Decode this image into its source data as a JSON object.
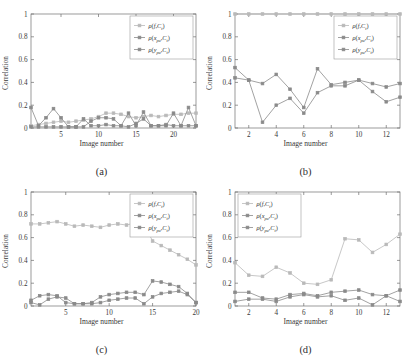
{
  "figure": {
    "axis_labels": {
      "x": "Image number",
      "y": "Correlation"
    },
    "series_names": {
      "s1": "ρ(f,C_t)",
      "s2": "ρ(x_pu,C_t)",
      "s3": "ρ(y_pu,C_t)"
    },
    "colors": {
      "s1": "#b9b9b9",
      "s2": "#8a8a8a",
      "s3": "#8a8a8a",
      "axis": "#6f6f6f"
    }
  },
  "chart_data": [
    {
      "type": "line",
      "panel": "a",
      "caption": "(a)",
      "title": "",
      "xlabel": "Image number",
      "ylabel": "Correlation",
      "xlim": [
        1,
        23
      ],
      "ylim": [
        0,
        1
      ],
      "xticks": [
        5,
        10,
        15,
        20
      ],
      "yticks": [
        0,
        0.2,
        0.4,
        0.6,
        0.8,
        1
      ],
      "ytick_labels": [
        "0",
        "0.2",
        "0.4",
        "0.6",
        "0.8",
        "1"
      ],
      "grid": false,
      "legend_position": "top-right",
      "x": [
        1,
        2,
        3,
        4,
        5,
        6,
        7,
        8,
        9,
        10,
        11,
        12,
        13,
        14,
        15,
        16,
        17,
        18,
        19,
        20,
        21,
        22,
        23
      ],
      "series": [
        {
          "name": "ρ(f,C_t)",
          "color": "#b9b9b9",
          "values": [
            0.02,
            0.03,
            0.04,
            0.05,
            0.06,
            0.05,
            0.06,
            0.07,
            0.08,
            0.1,
            0.13,
            0.13,
            0.12,
            0.1,
            0.09,
            0.1,
            0.11,
            0.1,
            0.11,
            0.12,
            0.12,
            0.13,
            0.13
          ]
        },
        {
          "name": "ρ(x_pu,C_t)",
          "color": "#8a8a8a",
          "values": [
            0.18,
            0.02,
            0.09,
            0.17,
            0.09,
            0.01,
            0.01,
            0.08,
            0.02,
            0.02,
            0.03,
            0.02,
            0.02,
            0.13,
            0.02,
            0.14,
            0.02,
            0.02,
            0.02,
            0.13,
            0.02,
            0.18,
            0.02
          ]
        },
        {
          "name": "ρ(y_pu,C_t)",
          "color": "#8a8a8a",
          "values": [
            0.01,
            0.01,
            0.01,
            0.01,
            0.01,
            0.01,
            0.01,
            0.01,
            0.06,
            0.09,
            0.09,
            0.08,
            0.02,
            0.01,
            0.04,
            0.08,
            0.02,
            0.02,
            0.03,
            0.02,
            0.02,
            0.02,
            0.02
          ]
        }
      ]
    },
    {
      "type": "line",
      "panel": "b",
      "caption": "(b)",
      "title": "",
      "xlabel": "Image number",
      "ylabel": "Correlation",
      "xlim": [
        1,
        13
      ],
      "ylim": [
        0,
        1
      ],
      "xticks": [
        2,
        4,
        6,
        8,
        10,
        12
      ],
      "yticks": [
        0,
        0.2,
        0.4,
        0.6,
        0.8,
        1
      ],
      "ytick_labels": [
        "0",
        "0.2",
        "0.4",
        "0.6",
        "0.8",
        "1"
      ],
      "grid": false,
      "legend_position": "top-right",
      "x": [
        1,
        2,
        3,
        4,
        5,
        6,
        7,
        8,
        9,
        10,
        11,
        12,
        13
      ],
      "series": [
        {
          "name": "ρ(f,C_t)",
          "color": "#b9b9b9",
          "values": [
            1,
            1,
            1,
            1,
            1,
            1,
            1,
            1,
            1,
            1,
            1,
            1,
            1
          ]
        },
        {
          "name": "ρ(x_pu,C_t)",
          "color": "#8a8a8a",
          "values": [
            0.53,
            0.42,
            0.39,
            0.47,
            0.34,
            0.18,
            0.52,
            0.38,
            0.4,
            0.42,
            0.39,
            0.36,
            0.39
          ]
        },
        {
          "name": "ρ(y_pu,C_t)",
          "color": "#8a8a8a",
          "values": [
            0.44,
            0.42,
            0.05,
            0.2,
            0.26,
            0.13,
            0.31,
            0.37,
            0.37,
            0.42,
            0.32,
            0.23,
            0.27
          ]
        }
      ]
    },
    {
      "type": "line",
      "panel": "c",
      "caption": "(c)",
      "title": "",
      "xlabel": "Image number",
      "ylabel": "Correlation",
      "xlim": [
        1,
        20
      ],
      "ylim": [
        0,
        1
      ],
      "xticks": [
        5,
        10,
        15,
        20
      ],
      "yticks": [
        0,
        0.2,
        0.4,
        0.6,
        0.8,
        1
      ],
      "ytick_labels": [
        "0",
        "0.2",
        "0.4",
        "0.6",
        "0.8",
        "1"
      ],
      "grid": false,
      "legend_position": "top-right",
      "x": [
        1,
        2,
        3,
        4,
        5,
        6,
        7,
        8,
        9,
        10,
        11,
        12,
        13,
        14,
        15,
        16,
        17,
        18,
        19,
        20
      ],
      "series": [
        {
          "name": "ρ(f,C_t)",
          "color": "#b9b9b9",
          "values": [
            0.72,
            0.72,
            0.73,
            0.74,
            0.72,
            0.7,
            0.71,
            0.7,
            0.69,
            0.71,
            0.72,
            0.71,
            0.73,
            0.72,
            0.57,
            0.53,
            0.49,
            0.45,
            0.41,
            0.36
          ]
        },
        {
          "name": "ρ(x_pu,C_t)",
          "color": "#8a8a8a",
          "values": [
            0.05,
            0.09,
            0.1,
            0.09,
            0.03,
            0.02,
            0.02,
            0.03,
            0.08,
            0.1,
            0.11,
            0.12,
            0.12,
            0.1,
            0.22,
            0.21,
            0.19,
            0.17,
            0.11,
            0.03
          ]
        },
        {
          "name": "ρ(y_pu,C_t)",
          "color": "#8a8a8a",
          "values": [
            0.03,
            0.01,
            0.06,
            0.08,
            0.07,
            0.02,
            0.02,
            0.02,
            0.03,
            0.05,
            0.06,
            0.07,
            0.07,
            0.02,
            0.08,
            0.11,
            0.12,
            0.13,
            0.1,
            0.03
          ]
        }
      ]
    },
    {
      "type": "line",
      "panel": "d",
      "caption": "(d)",
      "title": "",
      "xlabel": "Image number",
      "ylabel": "Correlation",
      "xlim": [
        1,
        13
      ],
      "ylim": [
        0,
        1
      ],
      "xticks": [
        2,
        4,
        6,
        8,
        10,
        12
      ],
      "yticks": [
        0,
        0.2,
        0.4,
        0.6,
        0.8,
        1
      ],
      "ytick_labels": [
        "0",
        "0.2",
        "0.4",
        "0.6",
        "0.8",
        "1"
      ],
      "grid": false,
      "legend_position": "top-left",
      "x": [
        1,
        2,
        3,
        4,
        5,
        6,
        7,
        8,
        9,
        10,
        11,
        12,
        13
      ],
      "series": [
        {
          "name": "ρ(f,C_t)",
          "color": "#b9b9b9",
          "values": [
            0.38,
            0.27,
            0.26,
            0.34,
            0.29,
            0.2,
            0.19,
            0.23,
            0.59,
            0.58,
            0.47,
            0.54,
            0.63
          ]
        },
        {
          "name": "ρ(x_pu,C_t)",
          "color": "#8a8a8a",
          "values": [
            0.12,
            0.12,
            0.07,
            0.06,
            0.1,
            0.11,
            0.09,
            0.12,
            0.13,
            0.14,
            0.1,
            0.09,
            0.14
          ]
        },
        {
          "name": "ρ(y_pu,C_t)",
          "color": "#8a8a8a",
          "values": [
            0.04,
            0.06,
            0.06,
            0.04,
            0.08,
            0.1,
            0.08,
            0.09,
            0.05,
            0.07,
            0.01,
            0.09,
            0.04
          ]
        }
      ]
    }
  ]
}
